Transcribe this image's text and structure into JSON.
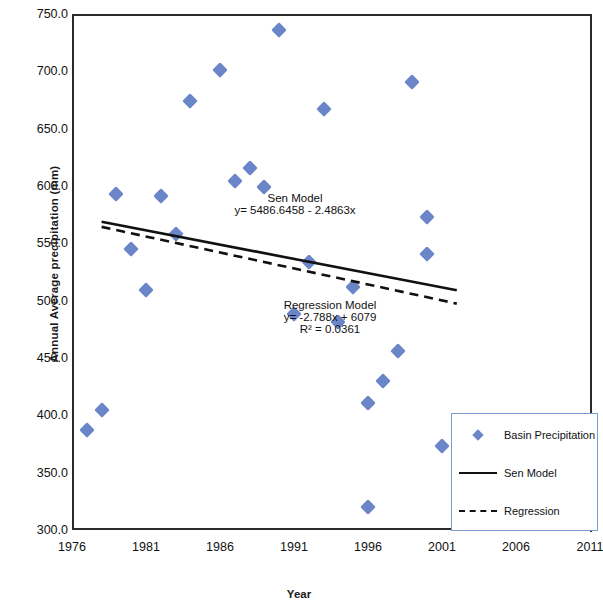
{
  "chart_data": {
    "type": "scatter",
    "title": "",
    "xlabel": "Year",
    "ylabel": "Annual Average precipitation  (mm)",
    "xlim": [
      1976,
      2011
    ],
    "ylim": [
      300.0,
      750.0
    ],
    "xticks": [
      "1976",
      "1981",
      "1986",
      "1991",
      "1996",
      "2001",
      "2006",
      "2011"
    ],
    "xtick_values": [
      1976,
      1981,
      1986,
      1991,
      1996,
      2001,
      2006,
      2011
    ],
    "yticks": [
      "300.0",
      "350.0",
      "400.0",
      "450.0",
      "500.0",
      "550.0",
      "600.0",
      "650.0",
      "700.0",
      "750.0"
    ],
    "ytick_values": [
      300.0,
      350.0,
      400.0,
      450.0,
      500.0,
      550.0,
      600.0,
      650.0,
      700.0,
      750.0
    ],
    "grid": false,
    "legend_position": "bottom-right",
    "marker_color": "#6a85c8",
    "line_color": "#111111",
    "legend": [
      {
        "label": "Basin Precipitation",
        "key": "diamond-marker"
      },
      {
        "label": "Sen Model",
        "key": "solid-line"
      },
      {
        "label": "Regression",
        "key": "dashed-line"
      }
    ],
    "series": [
      {
        "name": "Basin Precipitation",
        "type": "scatter",
        "x": [
          1977,
          1978,
          1979,
          1980,
          1981,
          1982,
          1983,
          1984,
          1986,
          1987,
          1988,
          1989,
          1990,
          1991,
          1992,
          1993,
          1994,
          1995,
          1996,
          1997,
          1998,
          1999,
          2000,
          2001
        ],
        "y": [
          387,
          405,
          593,
          545,
          509,
          591,
          558,
          674,
          701,
          604,
          616,
          599,
          736,
          488,
          534,
          667,
          481,
          512,
          411,
          430,
          456,
          691,
          573,
          373
        ],
        "extra_points": [
          {
            "x": 1996,
            "y": 320
          },
          {
            "x": 2000,
            "y": 541
          }
        ]
      },
      {
        "name": "Sen Model",
        "type": "line",
        "style": "solid",
        "equation": "y = 5486.6458 - 2.4863x",
        "intercept": 5486.6458,
        "slope": -2.4863,
        "x_range": [
          1978,
          2002
        ]
      },
      {
        "name": "Regression",
        "type": "line",
        "style": "dashed",
        "equation": "y = -2.788x + 6079",
        "intercept": 6079,
        "slope": -2.788,
        "r_squared": 0.0361,
        "x_range": [
          1978,
          2002
        ]
      }
    ],
    "annotations": [
      {
        "name": "sen-model-annotation",
        "lines": [
          "Sen Model",
          "y= 5486.6458 - 2.4863x"
        ],
        "x": 1991.3,
        "y": 583
      },
      {
        "name": "regression-model-annotation",
        "lines": [
          "Regression Model",
          "y= -2.788x + 6079",
          "R² = 0.0361"
        ],
        "x": 1991.2,
        "y": 481
      }
    ]
  },
  "annotation_text": {
    "sen_title": "Sen Model",
    "sen_equation": "y= 5486.6458 - 2.4863x",
    "reg_title": "Regression Model",
    "reg_equation": "y= -2.788x + 6079",
    "reg_r2": "R² = 0.0361"
  }
}
